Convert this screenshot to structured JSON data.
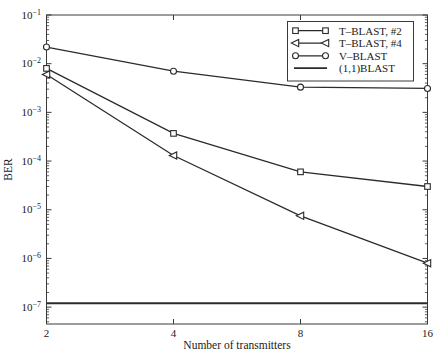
{
  "chart_data": {
    "type": "line",
    "title": "",
    "xlabel": "Number of transmitters",
    "ylabel": "BER",
    "x_scale": "log2",
    "y_scale": "log10",
    "grid": false,
    "legend_position": "upper right",
    "background": "#ffffff",
    "line_color": "#2b2b2b",
    "xlim": [
      2,
      16
    ],
    "ylim": [
      4.5e-08,
      0.1
    ],
    "x_ticks": [
      2,
      4,
      8,
      16
    ],
    "x_tick_labels": [
      "2",
      "4",
      "8",
      "16"
    ],
    "y_tick_base": "10",
    "y_tick_exponents": [
      -1,
      -2,
      -3,
      -4,
      -5,
      -6,
      -7
    ],
    "x": [
      2,
      4,
      8,
      16
    ],
    "series": [
      {
        "name": "T–BLAST, #2",
        "marker": "square",
        "line_width": 1.3,
        "values": [
          0.008,
          0.00037,
          6e-05,
          3e-05
        ]
      },
      {
        "name": "T–BLAST, #4",
        "marker": "triangle-left",
        "line_width": 1.3,
        "values": [
          0.006,
          0.00013,
          7.5e-06,
          8e-07
        ]
      },
      {
        "name": "V–BLAST",
        "marker": "circle",
        "line_width": 1.3,
        "values": [
          0.022,
          0.007,
          0.0033,
          0.0031
        ]
      },
      {
        "name": "(1,1)BLAST",
        "marker": "none",
        "line_width": 1.8,
        "values": [
          1.2e-07,
          1.2e-07,
          1.2e-07,
          1.2e-07
        ]
      }
    ]
  }
}
